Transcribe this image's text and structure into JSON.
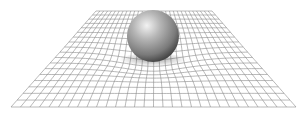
{
  "figure": {
    "grid": {
      "top_left": [
        96,
        11
      ],
      "top_right": [
        212,
        11
      ],
      "bottom_left": [
        11,
        107
      ],
      "bottom_right": [
        296,
        107
      ],
      "columns": 30,
      "rows": 18,
      "line_color": "#8a8a8a"
    },
    "sphere": {
      "center": [
        153,
        36
      ],
      "radius": 26,
      "highlight_color": "#e6e6e6",
      "mid_color": "#9a9a9a",
      "shadow_color": "#3a3a3a"
    },
    "well": {
      "center": [
        153,
        58
      ],
      "depth": 9,
      "radius_x": 60,
      "radius_y": 22
    }
  }
}
